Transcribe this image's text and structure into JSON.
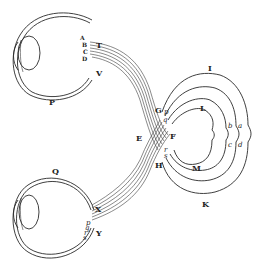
{
  "figure": {
    "labels": {
      "upper_eye": "P",
      "lower_eye": "Q",
      "upper_retina": [
        "A",
        "B",
        "C",
        "D"
      ],
      "upper_nerve_top": "T",
      "upper_nerve_bottom": "V",
      "lower_nerve_top": "X",
      "lower_nerve_bottom": "Y",
      "lower_retina": [
        "p",
        "q",
        "r",
        "s"
      ],
      "chiasm_left": "E",
      "chiasm_right": "F",
      "chiasm_top": "G",
      "chiasm_bottom": "H",
      "chiasm_fibers": [
        "p",
        "q",
        "r",
        "s"
      ],
      "outer_arc_top": "I",
      "outer_arc_bottom": "K",
      "inner_arc_top": "L",
      "inner_arc_bottom": "M",
      "tract_letters": [
        "b",
        "a",
        "c",
        "d"
      ]
    }
  }
}
